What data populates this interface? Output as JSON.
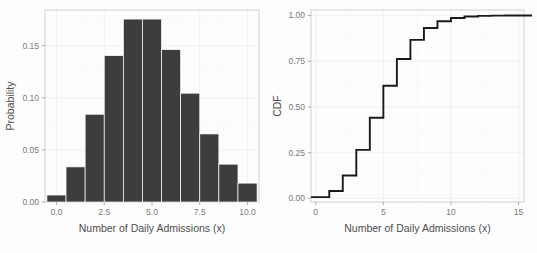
{
  "figure": {
    "background_color": "#fdfdfd",
    "panel_color": "#ffffff",
    "bar_color": "#3d3d3d",
    "line_color": "#1a1a1a",
    "grid_color": "#ececec",
    "tick_label_color": "#7a7a7a",
    "axis_title_color": "#4d4d4d"
  },
  "chart_data": [
    {
      "type": "bar",
      "panel": "left",
      "title": "",
      "xlabel": "Number of Daily Admissions (x)",
      "ylabel": "Probability",
      "x": [
        0,
        1,
        2,
        3,
        4,
        5,
        6,
        7,
        8,
        9,
        10
      ],
      "categories": [
        "0",
        "1",
        "2",
        "3",
        "4",
        "5",
        "6",
        "7",
        "8",
        "9",
        "10"
      ],
      "values": [
        0.0067,
        0.0337,
        0.0842,
        0.1404,
        0.1755,
        0.1755,
        0.1462,
        0.1044,
        0.0653,
        0.0363,
        0.0181
      ],
      "xlim": [
        -0.6,
        10.6
      ],
      "ylim": [
        0,
        0.1842
      ],
      "xticks": [
        0,
        2.5,
        5,
        7.5,
        10
      ],
      "xtick_labels": [
        "0.0",
        "2.5",
        "5.0",
        "7.5",
        "10.0"
      ],
      "yticks": [
        0.0,
        0.05,
        0.1,
        0.15
      ],
      "ytick_labels": [
        "0.00",
        "0.05",
        "0.10",
        "0.15"
      ],
      "grid": true,
      "legend": "none",
      "distribution": "Poisson PMF, lambda = 5"
    },
    {
      "type": "line",
      "panel": "right",
      "title": "",
      "xlabel": "Number of Daily Admissions (x)",
      "ylabel": "CDF",
      "x": [
        0,
        1,
        2,
        3,
        4,
        5,
        6,
        7,
        8,
        9,
        10,
        11,
        12,
        13,
        14,
        15
      ],
      "values": [
        0.0067,
        0.0404,
        0.1247,
        0.265,
        0.4405,
        0.616,
        0.7622,
        0.8666,
        0.9319,
        0.9682,
        0.9863,
        0.9945,
        0.998,
        0.9993,
        0.9998,
        0.9999
      ],
      "xlim": [
        -0.35,
        15.4
      ],
      "ylim": [
        -0.02,
        1.03
      ],
      "xticks": [
        0,
        5,
        10,
        15
      ],
      "xtick_labels": [
        "0",
        "5",
        "10",
        "15"
      ],
      "yticks": [
        0.0,
        0.25,
        0.5,
        0.75,
        1.0
      ],
      "ytick_labels": [
        "0.00",
        "0.25",
        "0.50",
        "0.75",
        "1.00"
      ],
      "grid": true,
      "legend": "none",
      "step_type": "hv",
      "distribution": "Poisson CDF, lambda = 5"
    }
  ]
}
